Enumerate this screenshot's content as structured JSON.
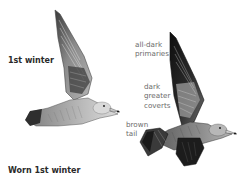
{
  "plate": {
    "subject": "gull plumage illustrations",
    "figures": [
      {
        "id": "first-winter",
        "caption": "1st winter",
        "pose": "flying, upper wing raised, side view facing right"
      },
      {
        "id": "worn-first-winter",
        "caption": "Worn 1st winter",
        "pose": "flying, wings raised, side view facing right",
        "annotations": [
          {
            "text": "all-dark\nprimaries"
          },
          {
            "text": "dark\ngreater\ncoverts"
          },
          {
            "text": "brown\ntail"
          }
        ]
      }
    ]
  },
  "colors": {
    "background": "#ffffff",
    "caption_text": "#2a2a2a",
    "annotation_text": "#6b6b6b",
    "plumage_light": "#c8c8c8",
    "plumage_mid": "#8a8a8a",
    "plumage_dark": "#2b2b2b",
    "wingtip_black": "#111111"
  }
}
